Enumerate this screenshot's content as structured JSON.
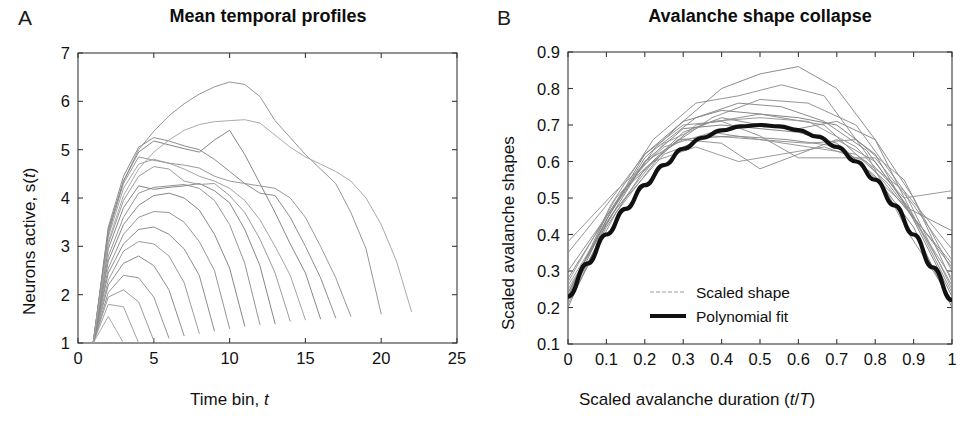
{
  "figure": {
    "width": 969,
    "height": 428,
    "background": "#ffffff",
    "line_color_light": "#9a9a9a",
    "line_color_dark": "#555555",
    "fit_color": "#111111",
    "axis_color": "#3a3a3a"
  },
  "panel_a": {
    "letter": "A",
    "title": "Mean temporal profiles",
    "xlabel_prefix": "Time bin, ",
    "xlabel_italic": "t",
    "ylabel_prefix": "Neurons active, s(",
    "ylabel_italic": "t",
    "ylabel_suffix": ")",
    "xticks": [
      "0",
      "5",
      "10",
      "15",
      "20",
      "25"
    ],
    "yticks": [
      "1",
      "2",
      "3",
      "4",
      "5",
      "6",
      "7"
    ]
  },
  "panel_b": {
    "letter": "B",
    "title": "Avalanche shape collapse",
    "xlabel_prefix": "Scaled avalanche duration (",
    "xlabel_italic_t": "t",
    "xlabel_slash": "/",
    "xlabel_italic_T": "T",
    "xlabel_suffix": ")",
    "ylabel": "Scaled avalanche shapes",
    "xticks": [
      "0",
      "0.1",
      "0.2",
      "0.3",
      "0.4",
      "0.5",
      "0.6",
      "0.7",
      "0.8",
      "0.9",
      "1"
    ],
    "yticks": [
      "0.1",
      "0.2",
      "0.3",
      "0.4",
      "0.5",
      "0.6",
      "0.7",
      "0.8",
      "0.9"
    ],
    "legend": [
      {
        "label": "Scaled shape",
        "style": "thin-gray"
      },
      {
        "label": "Polynomial fit",
        "style": "thick-black"
      }
    ]
  },
  "chart_data": [
    {
      "id": "mean-temporal-profiles",
      "type": "line",
      "title": "Mean temporal profiles",
      "xlabel": "Time bin, t",
      "ylabel": "Neurons active, s(t)",
      "xlim": [
        0,
        25
      ],
      "ylim": [
        1,
        7
      ],
      "xticks": [
        0,
        5,
        10,
        15,
        20,
        25
      ],
      "yticks": [
        1,
        2,
        3,
        4,
        5,
        6,
        7
      ],
      "grid": false,
      "legend": "none",
      "series": [
        {
          "name": "T=3",
          "shade": 0.3,
          "x": [
            1,
            2,
            3
          ],
          "y": [
            1.0,
            1.55,
            1.0
          ]
        },
        {
          "name": "T=4",
          "shade": 0.35,
          "x": [
            1,
            2,
            3,
            4
          ],
          "y": [
            1.0,
            1.8,
            1.75,
            1.0
          ]
        },
        {
          "name": "T=5",
          "shade": 0.4,
          "x": [
            1,
            2,
            3,
            4,
            5
          ],
          "y": [
            1.0,
            1.95,
            2.1,
            1.85,
            1.05
          ]
        },
        {
          "name": "T=6",
          "shade": 0.45,
          "x": [
            1,
            2,
            3,
            4,
            5,
            6
          ],
          "y": [
            1.0,
            2.05,
            2.4,
            2.35,
            1.95,
            1.1
          ]
        },
        {
          "name": "T=7",
          "shade": 0.5,
          "x": [
            1,
            2,
            3,
            4,
            5,
            6,
            7
          ],
          "y": [
            1.0,
            2.2,
            2.65,
            2.8,
            2.6,
            2.1,
            1.15
          ]
        },
        {
          "name": "T=8",
          "shade": 0.4,
          "x": [
            1,
            2,
            3,
            4,
            5,
            6,
            7,
            8
          ],
          "y": [
            1.0,
            2.3,
            2.9,
            3.1,
            3.05,
            2.8,
            2.25,
            1.2
          ]
        },
        {
          "name": "T=9",
          "shade": 0.5,
          "x": [
            1,
            2,
            3,
            4,
            5,
            6,
            7,
            8,
            9
          ],
          "y": [
            1.0,
            2.45,
            3.05,
            3.35,
            3.4,
            3.25,
            2.95,
            2.4,
            1.25
          ]
        },
        {
          "name": "T=10",
          "shade": 0.45,
          "x": [
            1,
            2,
            3,
            4,
            5,
            6,
            7,
            8,
            9,
            10
          ],
          "y": [
            1.0,
            2.55,
            3.25,
            3.6,
            3.72,
            3.7,
            3.5,
            3.1,
            2.5,
            1.3
          ]
        },
        {
          "name": "T=11",
          "shade": 0.55,
          "x": [
            1,
            2,
            3,
            4,
            5,
            6,
            7,
            8,
            9,
            10,
            11
          ],
          "y": [
            1.0,
            2.7,
            3.45,
            3.85,
            4.05,
            4.1,
            4.0,
            3.75,
            3.25,
            2.55,
            1.35
          ]
        },
        {
          "name": "T=12",
          "shade": 0.45,
          "x": [
            1,
            2,
            3,
            4,
            5,
            6,
            7,
            8,
            9,
            10,
            11,
            12
          ],
          "y": [
            1.0,
            2.8,
            3.6,
            4.1,
            4.22,
            4.25,
            4.28,
            4.2,
            3.95,
            3.45,
            2.65,
            1.38
          ]
        },
        {
          "name": "T=13",
          "shade": 0.55,
          "x": [
            1,
            2,
            3,
            4,
            5,
            6,
            7,
            8,
            9,
            10,
            11,
            12,
            13
          ],
          "y": [
            1.0,
            2.95,
            3.8,
            4.25,
            4.18,
            4.22,
            4.25,
            4.3,
            4.15,
            3.9,
            3.35,
            2.6,
            1.4
          ]
        },
        {
          "name": "T=14",
          "shade": 0.4,
          "x": [
            1,
            2,
            3,
            4,
            5,
            6,
            7,
            8,
            9,
            10,
            11,
            12,
            13,
            14
          ],
          "y": [
            1.0,
            3.05,
            3.95,
            4.45,
            4.65,
            4.6,
            4.35,
            4.28,
            4.3,
            4.05,
            3.7,
            3.15,
            2.45,
            1.45
          ]
        },
        {
          "name": "T=15",
          "shade": 0.35,
          "x": [
            1,
            2,
            3,
            4,
            5,
            6,
            7,
            8,
            9,
            10,
            11,
            12,
            13,
            14,
            15
          ],
          "y": [
            1.0,
            3.2,
            4.2,
            4.7,
            4.8,
            4.72,
            4.6,
            4.45,
            4.35,
            4.2,
            3.95,
            3.55,
            3.0,
            2.4,
            1.48
          ]
        },
        {
          "name": "T=16",
          "shade": 0.55,
          "x": [
            1,
            2,
            3,
            4,
            5,
            6,
            7,
            8,
            9,
            10,
            11,
            12,
            13,
            14,
            15,
            16
          ],
          "y": [
            1.0,
            3.35,
            4.35,
            4.95,
            5.18,
            5.1,
            5.02,
            4.95,
            5.2,
            5.4,
            4.9,
            4.3,
            3.7,
            3.05,
            2.45,
            1.5
          ]
        },
        {
          "name": "T=17",
          "shade": 0.5,
          "x": [
            1,
            2,
            3,
            4,
            5,
            6,
            7,
            8,
            9,
            10,
            11,
            12,
            13,
            14,
            15,
            16,
            17
          ],
          "y": [
            1.0,
            3.4,
            4.45,
            5.05,
            5.25,
            5.18,
            5.08,
            5.0,
            4.8,
            4.55,
            4.3,
            4.1,
            4.05,
            3.6,
            3.0,
            2.35,
            1.52
          ]
        },
        {
          "name": "T=18",
          "shade": 0.42,
          "x": [
            1,
            2,
            3,
            4,
            5,
            6,
            7,
            8,
            9,
            10,
            11,
            12,
            13,
            14,
            15,
            16,
            17,
            18
          ],
          "y": [
            1.0,
            3.3,
            4.3,
            4.85,
            4.78,
            4.72,
            4.68,
            4.62,
            4.45,
            4.35,
            4.3,
            4.25,
            4.2,
            4.0,
            3.6,
            3.0,
            2.35,
            1.55
          ]
        },
        {
          "name": "T=20",
          "shade": 0.45,
          "x": [
            1,
            2,
            3,
            4,
            5,
            6,
            7,
            8,
            9,
            10,
            11,
            12,
            13,
            14,
            15,
            16,
            17,
            18,
            19,
            20
          ],
          "y": [
            1.0,
            3.25,
            4.35,
            5.0,
            5.38,
            5.7,
            5.95,
            6.15,
            6.3,
            6.4,
            6.35,
            6.1,
            5.6,
            5.25,
            4.9,
            4.6,
            4.3,
            3.7,
            2.95,
            1.6
          ]
        },
        {
          "name": "T=22",
          "shade": 0.3,
          "x": [
            1,
            2,
            3,
            4,
            5,
            6,
            7,
            8,
            9,
            10,
            11,
            12,
            13,
            14,
            15,
            16,
            17,
            18,
            19,
            20,
            21,
            22
          ],
          "y": [
            1.0,
            3.1,
            4.05,
            4.6,
            4.95,
            5.2,
            5.4,
            5.52,
            5.58,
            5.6,
            5.62,
            5.55,
            5.3,
            5.05,
            4.85,
            4.7,
            4.55,
            4.35,
            4.0,
            3.45,
            2.7,
            1.65
          ]
        }
      ]
    },
    {
      "id": "avalanche-shape-collapse",
      "type": "line",
      "title": "Avalanche shape collapse",
      "xlabel": "Scaled avalanche duration (t/T)",
      "ylabel": "Scaled avalanche shapes",
      "xlim": [
        0,
        1
      ],
      "ylim": [
        0.1,
        0.9
      ],
      "xticks": [
        0,
        0.1,
        0.2,
        0.3,
        0.4,
        0.5,
        0.6,
        0.7,
        0.8,
        0.9,
        1
      ],
      "yticks": [
        0.1,
        0.2,
        0.3,
        0.4,
        0.5,
        0.6,
        0.7,
        0.8,
        0.9
      ],
      "grid": false,
      "legend": "inside-bottom-center",
      "legend_entries": [
        "Scaled shape",
        "Polynomial fit"
      ],
      "series": [
        {
          "name": "shape-1",
          "shade": 0.45,
          "x": [
            0,
            0.125,
            0.25,
            0.375,
            0.5,
            0.625,
            0.75,
            0.875,
            1
          ],
          "y": [
            0.21,
            0.46,
            0.63,
            0.72,
            0.77,
            0.76,
            0.7,
            0.52,
            0.25
          ]
        },
        {
          "name": "shape-2",
          "shade": 0.45,
          "x": [
            0,
            0.111,
            0.222,
            0.333,
            0.444,
            0.556,
            0.667,
            0.778,
            0.889,
            1
          ],
          "y": [
            0.23,
            0.48,
            0.66,
            0.76,
            0.78,
            0.81,
            0.78,
            0.62,
            0.4,
            0.22
          ]
        },
        {
          "name": "shape-3",
          "shade": 0.5,
          "x": [
            0,
            0.1,
            0.2,
            0.3,
            0.4,
            0.5,
            0.6,
            0.7,
            0.8,
            0.9,
            1
          ],
          "y": [
            0.24,
            0.44,
            0.61,
            0.71,
            0.8,
            0.84,
            0.86,
            0.8,
            0.66,
            0.45,
            0.24
          ]
        },
        {
          "name": "shape-4",
          "shade": 0.5,
          "x": [
            0,
            0.1,
            0.2,
            0.3,
            0.4,
            0.5,
            0.6,
            0.7,
            0.8,
            0.9,
            1
          ],
          "y": [
            0.22,
            0.42,
            0.58,
            0.68,
            0.72,
            0.7,
            0.69,
            0.71,
            0.66,
            0.5,
            0.27
          ]
        },
        {
          "name": "shape-5",
          "shade": 0.45,
          "x": [
            0,
            0.125,
            0.25,
            0.375,
            0.5,
            0.625,
            0.75,
            0.875,
            1
          ],
          "y": [
            0.25,
            0.47,
            0.62,
            0.67,
            0.66,
            0.65,
            0.66,
            0.55,
            0.3
          ]
        },
        {
          "name": "shape-6",
          "shade": 0.4,
          "x": [
            0,
            0.111,
            0.222,
            0.333,
            0.444,
            0.556,
            0.667,
            0.778,
            0.889,
            1
          ],
          "y": [
            0.26,
            0.45,
            0.6,
            0.64,
            0.6,
            0.62,
            0.64,
            0.6,
            0.46,
            0.28
          ]
        },
        {
          "name": "shape-7",
          "shade": 0.55,
          "x": [
            0,
            0.1,
            0.2,
            0.3,
            0.4,
            0.5,
            0.6,
            0.7,
            0.8,
            0.9,
            1
          ],
          "y": [
            0.2,
            0.43,
            0.6,
            0.69,
            0.7,
            0.69,
            0.68,
            0.65,
            0.56,
            0.42,
            0.2
          ]
        },
        {
          "name": "shape-8",
          "shade": 0.5,
          "x": [
            0,
            0.143,
            0.286,
            0.429,
            0.571,
            0.714,
            0.857,
            1
          ],
          "y": [
            0.28,
            0.52,
            0.66,
            0.67,
            0.66,
            0.64,
            0.5,
            0.32
          ]
        },
        {
          "name": "shape-9",
          "shade": 0.45,
          "x": [
            0,
            0.1,
            0.2,
            0.3,
            0.4,
            0.5,
            0.6,
            0.7,
            0.8,
            0.9,
            1
          ],
          "y": [
            0.35,
            0.48,
            0.62,
            0.7,
            0.71,
            0.67,
            0.61,
            0.61,
            0.61,
            0.48,
            0.33
          ]
        },
        {
          "name": "shape-10",
          "shade": 0.42,
          "x": [
            0,
            0.125,
            0.25,
            0.375,
            0.5,
            0.625,
            0.75,
            0.875,
            1
          ],
          "y": [
            0.38,
            0.52,
            0.64,
            0.68,
            0.66,
            0.64,
            0.62,
            0.52,
            0.36
          ]
        },
        {
          "name": "shape-11",
          "shade": 0.55,
          "x": [
            0,
            0.1,
            0.2,
            0.3,
            0.4,
            0.5,
            0.6,
            0.7,
            0.8,
            0.9,
            1
          ],
          "y": [
            0.22,
            0.44,
            0.62,
            0.71,
            0.74,
            0.73,
            0.72,
            0.7,
            0.62,
            0.44,
            0.23
          ]
        },
        {
          "name": "shape-12",
          "shade": 0.48,
          "x": [
            0,
            0.167,
            0.333,
            0.5,
            0.667,
            0.833,
            1
          ],
          "y": [
            0.3,
            0.55,
            0.7,
            0.73,
            0.7,
            0.54,
            0.31
          ]
        },
        {
          "name": "shape-13",
          "shade": 0.45,
          "x": [
            0,
            0.1,
            0.2,
            0.3,
            0.4,
            0.5,
            0.6,
            0.7,
            0.8,
            0.9,
            1
          ],
          "y": [
            0.23,
            0.45,
            0.6,
            0.66,
            0.65,
            0.58,
            0.62,
            0.66,
            0.6,
            0.45,
            0.26
          ]
        },
        {
          "name": "shape-14",
          "shade": 0.4,
          "x": [
            0,
            0.125,
            0.25,
            0.375,
            0.5,
            0.625,
            0.75,
            0.875,
            1
          ],
          "y": [
            0.27,
            0.5,
            0.65,
            0.71,
            0.72,
            0.71,
            0.64,
            0.5,
            0.52
          ]
        },
        {
          "name": "shape-15",
          "shade": 0.5,
          "x": [
            0,
            0.111,
            0.222,
            0.333,
            0.444,
            0.556,
            0.667,
            0.778,
            0.889,
            1
          ],
          "y": [
            0.24,
            0.46,
            0.63,
            0.72,
            0.76,
            0.75,
            0.71,
            0.63,
            0.47,
            0.41
          ]
        }
      ],
      "fit": {
        "name": "Polynomial fit",
        "x": [
          0,
          0.05,
          0.1,
          0.15,
          0.2,
          0.25,
          0.3,
          0.35,
          0.4,
          0.45,
          0.5,
          0.55,
          0.6,
          0.65,
          0.7,
          0.75,
          0.8,
          0.85,
          0.9,
          0.95,
          1
        ],
        "y": [
          0.23,
          0.32,
          0.4,
          0.47,
          0.535,
          0.59,
          0.635,
          0.665,
          0.685,
          0.696,
          0.7,
          0.696,
          0.686,
          0.668,
          0.64,
          0.6,
          0.55,
          0.48,
          0.4,
          0.31,
          0.22
        ]
      }
    }
  ]
}
